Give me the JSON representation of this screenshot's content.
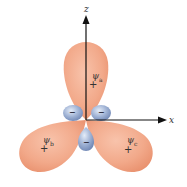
{
  "diagram": {
    "axes": {
      "vertical": {
        "label": "z"
      },
      "horizontal": {
        "label": "x"
      }
    },
    "lobes": [
      {
        "id": "a",
        "symbol": "ψ",
        "subscript": "a",
        "sign": "+"
      },
      {
        "id": "b",
        "symbol": "ψ",
        "subscript": "b",
        "sign": "+"
      },
      {
        "id": "c",
        "symbol": "ψ",
        "subscript": "c",
        "sign": "+"
      }
    ],
    "small_lobes": [
      {
        "sign": "−"
      },
      {
        "sign": "−"
      },
      {
        "sign": "−"
      }
    ],
    "colors": {
      "positive_lobe": "#f2a98a",
      "positive_lobe_edge": "#e8906e",
      "negative_lobe": "#8fa3c8",
      "negative_lobe_highlight": "#d6e0f0",
      "axis": "#111111"
    }
  }
}
